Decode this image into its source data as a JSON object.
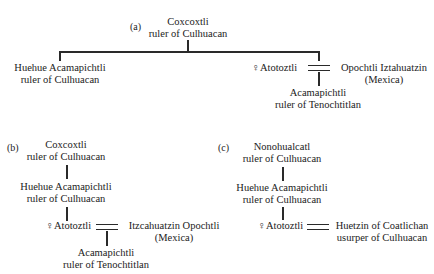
{
  "diagrams": {
    "a": {
      "label": "(a)",
      "root": {
        "name": "Coxcoxtli",
        "title": "ruler of Culhuacan"
      },
      "child_left": {
        "name": "Huehue Acamapichtli",
        "title": "ruler of Culhuacan"
      },
      "female": {
        "symbol": "♀",
        "name": "Atotoztli"
      },
      "spouse": {
        "name": "Opochtli Iztahuatzin",
        "title": "(Mexica)"
      },
      "offspring": {
        "name": "Acamapichtli",
        "title": "ruler of Tenochtitlan"
      }
    },
    "b": {
      "label": "(b)",
      "root": {
        "name": "Coxcoxtli",
        "title": "ruler of Culhuacan"
      },
      "child": {
        "name": "Huehue Acamapichtli",
        "title": "ruler of Culhuacan"
      },
      "female": {
        "symbol": "♀",
        "name": "Atotoztli"
      },
      "spouse": {
        "name": "Itzcahuatzin Opochtli",
        "title": "(Mexica)"
      },
      "offspring": {
        "name": "Acamapichtli",
        "title": "ruler of Tenochtitlan"
      }
    },
    "c": {
      "label": "(c)",
      "root": {
        "name": "Nonohualcatl",
        "title": "ruler of Culhuacan"
      },
      "child": {
        "name": "Huehue Acamapichtli",
        "title": "ruler of Culhuacan"
      },
      "female": {
        "symbol": "♀",
        "name": "Atotoztli"
      },
      "spouse": {
        "name": "Huetzin of Coatlichan",
        "title": "usurper of Culhuacan"
      }
    }
  }
}
